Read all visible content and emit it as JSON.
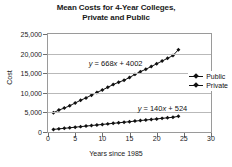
{
  "chart_data": {
    "type": "scatter",
    "title": "Mean Costs for 4-Year Colleges, Private and Public",
    "title_line1": "Mean Costs for 4-Year Colleges,",
    "title_line2": "Private and Public",
    "xlabel": "Years since 1985",
    "ylabel": "Cost",
    "xlim": [
      0,
      30
    ],
    "ylim": [
      0,
      25000
    ],
    "xticks": [
      0,
      5,
      10,
      15,
      20,
      25,
      30
    ],
    "xtick_labels": [
      "0",
      "5",
      "10",
      "15",
      "20",
      "25",
      "30"
    ],
    "yticks": [
      0,
      5000,
      10000,
      15000,
      20000,
      25000
    ],
    "ytick_labels": [
      "0",
      "5,000",
      "10,000",
      "15,000",
      "20,000",
      "25,000"
    ],
    "grid": "horizontal",
    "legend_position": "center-right",
    "annotations": [
      {
        "text": "y = 668x + 4002",
        "x": 7.5,
        "y": 17500,
        "series": "Private"
      },
      {
        "text": "y = 140x + 524",
        "x": 16.5,
        "y": 6200,
        "series": "Public"
      }
    ],
    "series": [
      {
        "name": "Public",
        "marker": "diamond",
        "color": "#111111",
        "x": [
          1,
          2,
          3,
          4,
          5,
          6,
          7,
          8,
          9,
          10,
          11,
          12,
          13,
          14,
          15,
          16,
          17,
          18,
          19,
          20,
          21,
          22,
          23,
          24
        ],
        "values": [
          660,
          800,
          940,
          1080,
          1230,
          1370,
          1510,
          1650,
          1790,
          1930,
          2070,
          2210,
          2350,
          2490,
          2630,
          2780,
          2920,
          3060,
          3200,
          3340,
          3480,
          3620,
          3760,
          4000
        ]
      },
      {
        "name": "Private",
        "marker": "diamond",
        "color": "#111111",
        "x": [
          1,
          2,
          3,
          4,
          5,
          6,
          7,
          8,
          9,
          10,
          11,
          12,
          13,
          14,
          15,
          16,
          17,
          18,
          19,
          20,
          21,
          22,
          23,
          24
        ],
        "values": [
          4900,
          5600,
          6100,
          6700,
          7400,
          8100,
          8700,
          9400,
          10100,
          10700,
          11400,
          12100,
          12700,
          13200,
          13900,
          14700,
          15400,
          16000,
          16700,
          17400,
          18100,
          18800,
          19500,
          21000
        ]
      }
    ]
  },
  "legend": {
    "items": [
      {
        "label": "Public"
      },
      {
        "label": "Private"
      }
    ]
  }
}
